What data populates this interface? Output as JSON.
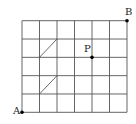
{
  "figure": {
    "grid": {
      "columns": 6,
      "rows": 5
    },
    "points": [
      {
        "id": "A",
        "label": "A",
        "col": 0,
        "row": 0
      },
      {
        "id": "P",
        "label": "P",
        "col": 4,
        "row": 3
      },
      {
        "id": "B",
        "label": "B",
        "col": 6,
        "row": 5
      }
    ],
    "diagonals": [
      {
        "from": [
          1,
          3
        ],
        "to": [
          2,
          4
        ]
      },
      {
        "from": [
          1,
          1
        ],
        "to": [
          2,
          2
        ]
      }
    ],
    "colors": {
      "line": "#555555",
      "point": "#000000"
    }
  }
}
